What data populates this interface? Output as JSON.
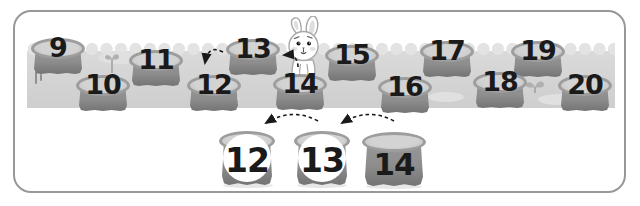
{
  "worksheet": {
    "field": {
      "top_row": [
        "9",
        "11",
        "13",
        "15",
        "17",
        "19"
      ],
      "bottom_row": [
        "10",
        "12",
        "14",
        "16",
        "18",
        "20"
      ]
    },
    "answer_row": [
      "12",
      "13",
      "14"
    ],
    "answer_circled": [
      true,
      true,
      false
    ]
  },
  "icons": {
    "bunny": "bunny-icon",
    "sprout": "sprout-icon",
    "arrow": "dashed-backward-arrow-icon"
  },
  "colors": {
    "frame_border": "#989898",
    "ground_band": "#d4d4d4",
    "scallop": "#e3e3e3",
    "stump_body": "#8d8d8d",
    "stump_top": "#c9c9c9",
    "stump_rim": "#9d9d9d",
    "number_text": "#1a1a1a",
    "answer_circle_fill": "#ffffff",
    "arrow": "#1a1a1a"
  }
}
